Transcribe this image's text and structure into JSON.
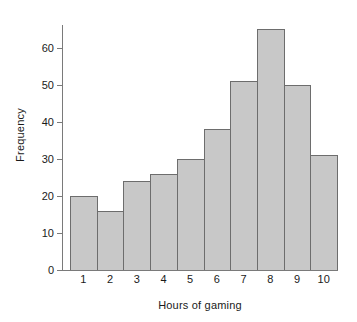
{
  "chart_data": {
    "type": "bar",
    "title": "",
    "subtitle": "",
    "xlabel": "Hours of gaming",
    "ylabel": "Frequency",
    "categories": [
      "1",
      "2",
      "3",
      "4",
      "5",
      "6",
      "7",
      "8",
      "9",
      "10"
    ],
    "values": [
      20,
      16,
      24,
      26,
      30,
      38,
      51,
      65,
      50,
      31
    ],
    "series": [
      {
        "name": "Frequency",
        "values": [
          20,
          16,
          24,
          26,
          30,
          38,
          51,
          65,
          50,
          31
        ]
      }
    ],
    "ylim": [
      0,
      68
    ],
    "yticks": [
      0,
      10,
      20,
      30,
      40,
      50,
      60
    ],
    "ytick_labels": [
      "0",
      "10",
      "20",
      "30",
      "40",
      "50",
      "60"
    ],
    "xtick_labels": [
      "1",
      "2",
      "3",
      "4",
      "5",
      "6",
      "7",
      "8",
      "9",
      "10"
    ],
    "grid": false,
    "legend": false,
    "legend_position": "none",
    "bar_fill_color": "#c8c8c8",
    "bar_edge_color": "#6d6d6d",
    "axis_color": "#7a7a7a",
    "background_color": "#ffffff",
    "annotations": []
  }
}
